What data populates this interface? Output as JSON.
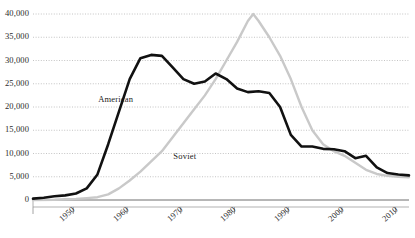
{
  "chart_data": {
    "type": "line",
    "title": "",
    "subtitle": "",
    "xlabel": "",
    "ylabel": "",
    "xlim": [
      1945,
      2015
    ],
    "ylim": [
      0,
      40000
    ],
    "grid": true,
    "legend_position": "inline-annotation",
    "y_ticks": [
      0,
      5000,
      10000,
      15000,
      20000,
      25000,
      30000,
      35000,
      40000
    ],
    "y_tick_labels": [
      "0",
      "5,000",
      "10,000",
      "15,000",
      "20,000",
      "25,000",
      "30,000",
      "35,000",
      "40,000"
    ],
    "x_ticks": [
      1950,
      1960,
      1970,
      1980,
      1990,
      2000,
      2010
    ],
    "x_tick_labels": [
      "1950",
      "1960",
      "1970",
      "1980",
      "1990",
      "2000",
      "2010"
    ],
    "annotations": [
      {
        "text": "American",
        "x": 1957.5,
        "y": 21500
      },
      {
        "text": "Soviet",
        "x": 1971.5,
        "y": 9200
      }
    ],
    "series": [
      {
        "name": "American",
        "color": "#111111",
        "x": [
          1945,
          1947,
          1949,
          1951,
          1953,
          1955,
          1957,
          1959,
          1961,
          1963,
          1965,
          1967,
          1969,
          1971,
          1973,
          1975,
          1977,
          1979,
          1981,
          1983,
          1985,
          1987,
          1989,
          1991,
          1993,
          1995,
          1997,
          1999,
          2001,
          2003,
          2005,
          2007,
          2009,
          2011,
          2013,
          2015
        ],
        "values": [
          300,
          500,
          800,
          1000,
          1400,
          2500,
          5500,
          12000,
          19000,
          26000,
          30500,
          31200,
          31000,
          28500,
          26000,
          25000,
          25500,
          27200,
          26000,
          24000,
          23200,
          23400,
          23000,
          20000,
          14000,
          11500,
          11500,
          11000,
          10900,
          10500,
          9000,
          9500,
          7000,
          5800,
          5500,
          5300
        ]
      },
      {
        "name": "Soviet",
        "color": "#c9c9c9",
        "x": [
          1945,
          1949,
          1951,
          1953,
          1955,
          1957,
          1959,
          1961,
          1963,
          1965,
          1967,
          1969,
          1971,
          1973,
          1975,
          1977,
          1979,
          1981,
          1983,
          1985,
          1986,
          1987,
          1989,
          1991,
          1993,
          1995,
          1997,
          1999,
          2001,
          2003,
          2005,
          2007,
          2009,
          2011,
          2013,
          2015
        ],
        "values": [
          0,
          50,
          150,
          250,
          400,
          600,
          1200,
          2500,
          4200,
          6100,
          8300,
          10500,
          13500,
          16500,
          19500,
          22500,
          26000,
          30000,
          34000,
          38500,
          40000,
          38500,
          35000,
          31000,
          26000,
          20000,
          15000,
          12000,
          10500,
          9500,
          8000,
          6500,
          5600,
          5200,
          5000,
          4900
        ]
      }
    ]
  },
  "axes": {
    "axis_color": "#a8a8a8",
    "gridline_color": "#b5b5b5",
    "tick_color": "#9a9a9a",
    "zero_baseline": "#6f6f6f"
  }
}
